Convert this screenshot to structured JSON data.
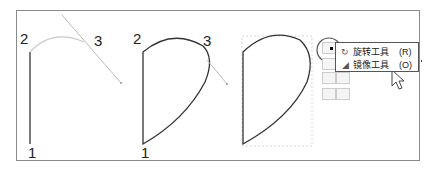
{
  "figure": {
    "panels": [
      {
        "id": "step1",
        "labels": {
          "point1": "1",
          "point2": "2",
          "point3": "3"
        }
      },
      {
        "id": "step2",
        "labels": {
          "point1": "1",
          "point2": "2",
          "point3": "3"
        }
      },
      {
        "id": "step3"
      }
    ]
  },
  "tool_menu": {
    "items": [
      {
        "icon": "rotate-icon",
        "label": "旋转工具",
        "shortcut": "(R)",
        "selected": true
      },
      {
        "icon": "reflect-icon",
        "label": "镜像工具",
        "shortcut": "(O)",
        "selected": false
      }
    ]
  },
  "colors": {
    "stroke": "#333333",
    "guide": "#bbbbbb",
    "frame": "#8a8a8a"
  }
}
